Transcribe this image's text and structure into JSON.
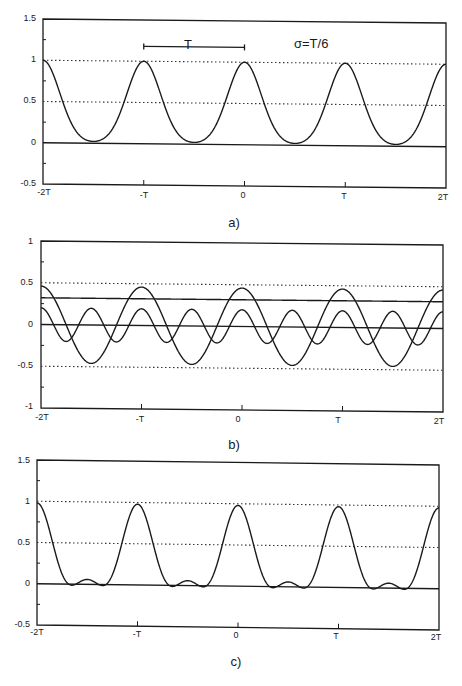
{
  "chart_data": [
    {
      "type": "line",
      "panel": "a",
      "caption": "a)",
      "title": "",
      "annotation": "σ=T/6",
      "bracket_label": "T",
      "bracket_span": [
        "-T",
        "0"
      ],
      "xlabel": "",
      "ylabel": "",
      "x_ticks": [
        "-2T",
        "-T",
        "0",
        "T",
        "2T"
      ],
      "y_ticks": [
        "1.5",
        "1",
        "0.5",
        "0",
        "-0.5"
      ],
      "xlim": [
        "-2T",
        "2T"
      ],
      "ylim": [
        -0.5,
        1.5
      ],
      "grid": false,
      "reference_lines": [
        {
          "y": 1.0,
          "style": "dotted"
        },
        {
          "y": 0.5,
          "style": "dotted"
        },
        {
          "y": 0.0,
          "style": "solid"
        }
      ],
      "series": [
        {
          "name": "Gaussian pulse train (sigma = T/6)",
          "x_in_T": [
            -2,
            -1.75,
            -1.5,
            -1.25,
            -1,
            -0.75,
            -0.5,
            -0.25,
            0,
            0.25,
            0.5,
            0.75,
            1,
            1.25,
            1.5,
            1.75,
            2
          ],
          "values": [
            1.0,
            0.32,
            0.02,
            0.32,
            1.0,
            0.32,
            0.02,
            0.32,
            1.0,
            0.32,
            0.02,
            0.32,
            1.0,
            0.32,
            0.02,
            0.32,
            1.0
          ]
        }
      ]
    },
    {
      "type": "line",
      "panel": "b",
      "caption": "b)",
      "title": "",
      "xlabel": "",
      "ylabel": "",
      "x_ticks": [
        "-2T",
        "-T",
        "0",
        "T",
        "2T"
      ],
      "y_ticks": [
        "1",
        "0.5",
        "0",
        "-0.5",
        "-1"
      ],
      "xlim": [
        "-2T",
        "2T"
      ],
      "ylim": [
        -1,
        1
      ],
      "grid": false,
      "reference_lines": [
        {
          "y": 0.5,
          "style": "dotted"
        },
        {
          "y": -0.5,
          "style": "dotted"
        },
        {
          "y": 0.0,
          "style": "solid"
        }
      ],
      "series": [
        {
          "name": "DC component",
          "values_const": 0.32
        },
        {
          "name": "Fundamental harmonic",
          "amplitude": 0.46,
          "harmonic": 1,
          "x_in_T": [
            -2,
            -1.5,
            -1,
            -0.5,
            0,
            0.5,
            1,
            1.5,
            2
          ],
          "values": [
            0.46,
            -0.46,
            0.46,
            -0.46,
            0.46,
            -0.46,
            0.46,
            -0.46,
            0.46
          ]
        },
        {
          "name": "Second harmonic",
          "amplitude": 0.2,
          "harmonic": 2,
          "x_in_T": [
            -2,
            -1.75,
            -1.5,
            -1.25,
            -1,
            -0.75,
            -0.5,
            -0.25,
            0,
            0.25,
            0.5,
            0.75,
            1,
            1.25,
            1.5,
            1.75,
            2
          ],
          "values": [
            0.2,
            -0.2,
            0.2,
            -0.2,
            0.2,
            -0.2,
            0.2,
            -0.2,
            0.2,
            -0.2,
            0.2,
            -0.2,
            0.2,
            -0.2,
            0.2,
            -0.2,
            0.2
          ]
        }
      ]
    },
    {
      "type": "line",
      "panel": "c",
      "caption": "c)",
      "title": "",
      "xlabel": "",
      "ylabel": "",
      "x_ticks": [
        "-2T",
        "-T",
        "0",
        "T",
        "2T"
      ],
      "y_ticks": [
        "1.5",
        "1",
        "0.5",
        "0",
        "-0.5"
      ],
      "xlim": [
        "-2T",
        "2T"
      ],
      "ylim": [
        -0.5,
        1.5
      ],
      "grid": false,
      "reference_lines": [
        {
          "y": 1.0,
          "style": "dotted"
        },
        {
          "y": 0.5,
          "style": "dotted"
        },
        {
          "y": 0.0,
          "style": "solid"
        }
      ],
      "series": [
        {
          "name": "Sum of DC + first two harmonics",
          "x_in_T": [
            -2,
            -1.75,
            -1.5,
            -1.25,
            -1,
            -0.75,
            -0.5,
            -0.25,
            0,
            0.25,
            0.5,
            0.75,
            1,
            1.25,
            1.5,
            1.75,
            2
          ],
          "values": [
            0.98,
            0.12,
            0.06,
            0.12,
            0.98,
            0.12,
            0.06,
            0.12,
            0.98,
            0.12,
            0.06,
            0.12,
            0.98,
            0.12,
            0.06,
            0.12,
            0.98
          ]
        }
      ]
    }
  ],
  "panels": {
    "a": {
      "caption": "a)",
      "annotation": "σ=T/6",
      "bracket_label": "T",
      "y_ticks": [
        "1.5",
        "1",
        "0.5",
        "0",
        "-0.5"
      ],
      "x_ticks": [
        "-2T",
        "-T",
        "0",
        "T",
        "2T"
      ]
    },
    "b": {
      "caption": "b)",
      "y_ticks": [
        "1",
        "0.5",
        "0",
        "-0.5",
        "-1"
      ],
      "x_ticks": [
        "-2T",
        "-T",
        "0",
        "T",
        "2T"
      ]
    },
    "c": {
      "caption": "c)",
      "y_ticks": [
        "1.5",
        "1",
        "0.5",
        "0",
        "-0.5"
      ],
      "x_ticks": [
        "-2T",
        "-T",
        "0",
        "T",
        "2T"
      ]
    }
  },
  "params": {
    "sigma_over_T": 0.1666667,
    "dc": 0.32,
    "h1": 0.46,
    "h2": 0.2
  },
  "colors": {
    "line": "#1a1a1a",
    "dotted": "#333333",
    "background": "#ffffff"
  }
}
